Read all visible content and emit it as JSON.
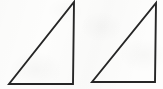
{
  "figure": {
    "title": "Two right triangles",
    "canvas": {
      "width": 163,
      "height": 89,
      "background_color": "#fdfdfc"
    },
    "style": {
      "stroke_color": "#262626",
      "stroke_width": 1.9,
      "fill": "none"
    },
    "shapes": [
      {
        "name": "left-triangle",
        "kind": "right-triangle",
        "right_angle_vertex": "bottom-right",
        "points": "9,84 73,84 74,2",
        "vertices": {
          "bottom_left": [
            9,
            84
          ],
          "bottom_right": [
            73,
            84
          ],
          "apex_top_right": [
            74,
            2
          ]
        },
        "legs": {
          "vertical_px": 82,
          "horizontal_px": 64
        }
      },
      {
        "name": "right-triangle",
        "kind": "right-triangle",
        "right_angle_vertex": "bottom-right",
        "points": "92,82 155,82 156,3",
        "vertices": {
          "bottom_left": [
            92,
            82
          ],
          "bottom_right": [
            155,
            82
          ],
          "apex_top_right": [
            156,
            3
          ]
        },
        "legs": {
          "vertical_px": 79,
          "horizontal_px": 63
        }
      }
    ]
  }
}
